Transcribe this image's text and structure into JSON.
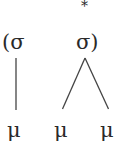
{
  "diagram": {
    "type": "prosodic-tree",
    "stress_mark": "*",
    "syllables": [
      {
        "label": "(σ",
        "moras": [
          "μ"
        ]
      },
      {
        "label": "σ)",
        "moras": [
          "μ",
          "μ"
        ],
        "stressed": true
      }
    ],
    "mora_labels": [
      "μ",
      "μ",
      "μ"
    ],
    "line_color": "#444444"
  }
}
